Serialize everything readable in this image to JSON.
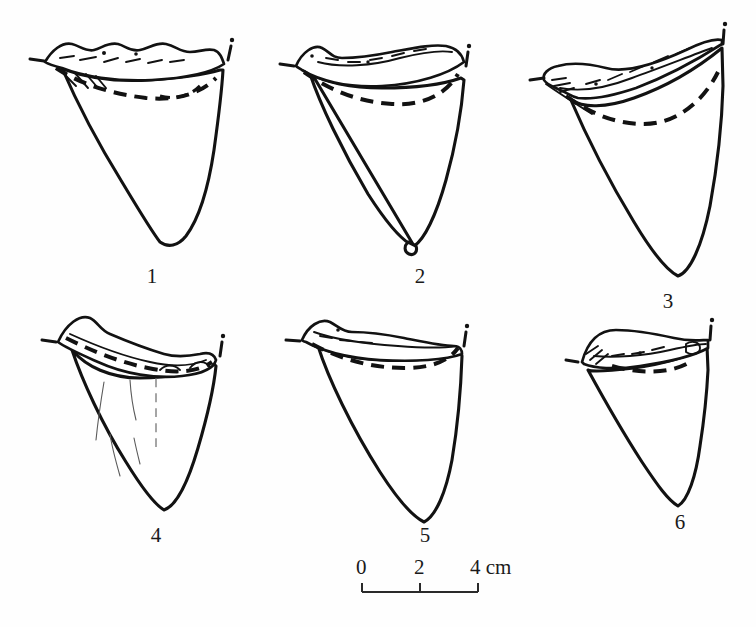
{
  "figure": {
    "kind": "scientific-line-illustration",
    "background_color": "#ffffff",
    "ink_color": "#121212",
    "specimen_count": 6,
    "view": "lingual/labial outline drawings with dashed enamel-root boundary"
  },
  "specimens": [
    {
      "number": "1",
      "label": "1",
      "label_x": 132,
      "label_y": 266,
      "row": 1,
      "column": 1,
      "description": "broad triangular crown, bumpy root band across top, bold dashed enamel line"
    },
    {
      "number": "2",
      "label": "2",
      "label_x": 400,
      "label_y": 266,
      "row": 1,
      "column": 2,
      "description": "triangular crown with notched apex tip, concave upper root margin"
    },
    {
      "number": "3",
      "label": "3",
      "label_x": 648,
      "label_y": 291,
      "row": 1,
      "column": 3,
      "description": "obliquely inclined crown, root wing sloping down to the left with hatching"
    },
    {
      "number": "4",
      "label": "4",
      "label_x": 136,
      "label_y": 525,
      "row": 2,
      "column": 1,
      "description": "crown with fine vertical cracks on the face, thick dashed enamel band"
    },
    {
      "number": "5",
      "label": "5",
      "label_x": 405,
      "label_y": 525,
      "row": 2,
      "column": 2,
      "description": "narrow triangular crown, near-vertical right edge"
    },
    {
      "number": "6",
      "label": "6",
      "label_x": 660,
      "label_y": 512,
      "row": 2,
      "column": 3,
      "description": "smaller tooth, elongate flattened root band"
    }
  ],
  "scale_bar": {
    "caption_unit": "cm",
    "tick_labels": [
      "0",
      "2",
      "4 cm"
    ],
    "ticks": [
      {
        "label": "0",
        "value": 0,
        "x": 362
      },
      {
        "label": "2",
        "value": 2,
        "x": 420
      },
      {
        "label": "4 cm",
        "value": 4,
        "x": 478
      }
    ],
    "bar_left_x": 362,
    "bar_right_x": 478,
    "bar_y": 592,
    "label_y": 557,
    "bar_color": "#2a2a2a"
  }
}
